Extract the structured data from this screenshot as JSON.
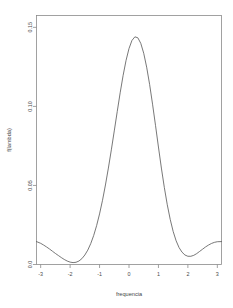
{
  "chart_data": {
    "type": "line",
    "title": "",
    "subtitle": "",
    "xlabel": "frequencia",
    "ylabel": "f(lambda)",
    "xlim": [
      -3.141592653589793,
      3.141592653589793
    ],
    "ylim": [
      0.0,
      0.1575
    ],
    "grid": false,
    "legend": null,
    "legend_position": "none",
    "xticks": [
      -3,
      -2,
      -1,
      0,
      1,
      2,
      3
    ],
    "xticklabels": [
      "-3",
      "-2",
      "-1",
      "0",
      "1",
      "2",
      "3"
    ],
    "yticks": [
      0.0,
      0.05,
      0.1,
      0.15
    ],
    "yticklabels": [
      "0.0",
      "0.05",
      "0.10",
      "0.15"
    ],
    "series": [
      {
        "name": "spectral density",
        "color": "#555555",
        "x": [
          -3.1416,
          -3.0,
          -2.9,
          -2.8,
          -2.7,
          -2.6,
          -2.5,
          -2.4,
          -2.3,
          -2.2,
          -2.1,
          -2.0,
          -1.9,
          -1.8,
          -1.7,
          -1.6,
          -1.5,
          -1.4,
          -1.3,
          -1.2,
          -1.1,
          -1.0,
          -0.9,
          -0.8,
          -0.7,
          -0.6,
          -0.5,
          -0.4,
          -0.3,
          -0.2,
          -0.1,
          0.0,
          0.1,
          0.2,
          0.3,
          0.4,
          0.5,
          0.6,
          0.7,
          0.8,
          0.9,
          1.0,
          1.1,
          1.2,
          1.3,
          1.4,
          1.5,
          1.6,
          1.7,
          1.8,
          1.9,
          2.0,
          2.1,
          2.2,
          2.3,
          2.4,
          2.5,
          2.6,
          2.7,
          2.8,
          2.9,
          3.0,
          3.1416
        ],
        "y": [
          0.0145,
          0.0134,
          0.0123,
          0.0111,
          0.0098,
          0.0084,
          0.007,
          0.0057,
          0.0044,
          0.0032,
          0.0022,
          0.0015,
          0.0012,
          0.0014,
          0.0022,
          0.0037,
          0.006,
          0.0091,
          0.0132,
          0.0183,
          0.0246,
          0.032,
          0.0406,
          0.0503,
          0.061,
          0.0725,
          0.0845,
          0.0967,
          0.1086,
          0.1196,
          0.1291,
          0.1366,
          0.1417,
          0.144,
          0.1434,
          0.1399,
          0.1336,
          0.1248,
          0.1139,
          0.1014,
          0.088,
          0.0743,
          0.061,
          0.0487,
          0.0378,
          0.0285,
          0.0209,
          0.015,
          0.0107,
          0.0078,
          0.006,
          0.0052,
          0.0052,
          0.0058,
          0.0069,
          0.0083,
          0.0097,
          0.0111,
          0.0123,
          0.0133,
          0.014,
          0.0144,
          0.0145
        ]
      }
    ],
    "annotations": {
      "peak_x": 0.15,
      "peak_y": 0.1555,
      "trough_left_x": -2.05,
      "trough_right_x": 2.05,
      "trough_y": 0.0
    }
  },
  "figure": {
    "background_color": "#ffffff",
    "frame_color": "#8a8a8a",
    "line_color": "#555555"
  }
}
